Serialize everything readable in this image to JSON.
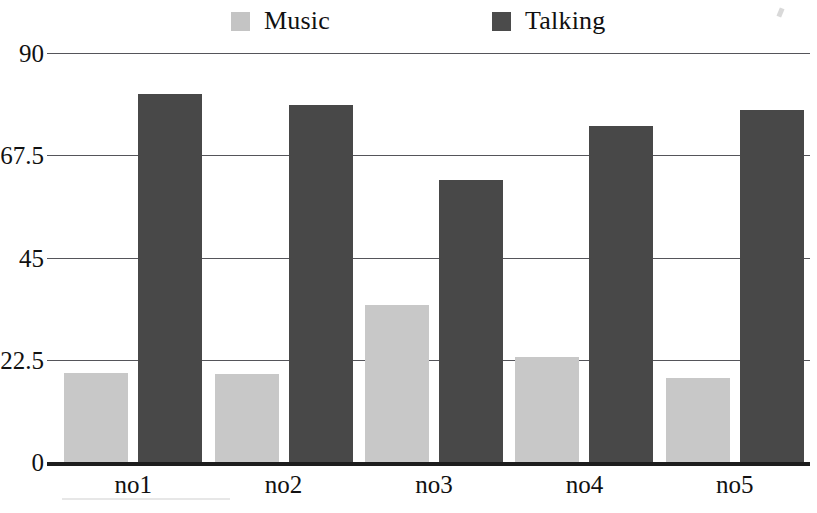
{
  "chart_data": {
    "type": "bar",
    "title": "",
    "subtitle": "",
    "xlabel": "",
    "ylabel": "",
    "categories": [
      "no1",
      "no2",
      "no3",
      "no4",
      "no5"
    ],
    "series": [
      {
        "name": "Music",
        "color": "#c8c8c8",
        "values": [
          19.5,
          19.3,
          34.5,
          23.0,
          18.5
        ]
      },
      {
        "name": "Talking",
        "color": "#484848",
        "values": [
          81.0,
          78.5,
          62.0,
          74.0,
          77.5
        ]
      }
    ],
    "ylim": [
      0,
      90
    ],
    "yticks": [
      0,
      22.5,
      45,
      67.5,
      90
    ],
    "ytick_labels": [
      "0",
      "22.5",
      "45",
      "67.5",
      "90"
    ],
    "grid": true,
    "legend_position": "top",
    "annotations": []
  },
  "legend": {
    "entries": [
      {
        "label": "Music",
        "swatch": "music-swatch"
      },
      {
        "label": "Talking",
        "swatch": "talking-swatch"
      }
    ]
  },
  "axes": {
    "y": {
      "ticks": [
        "90",
        "67.5",
        "45",
        "22.5",
        "0"
      ]
    },
    "x": {
      "ticks": [
        "no1",
        "no2",
        "no3",
        "no4",
        "no5"
      ]
    }
  }
}
